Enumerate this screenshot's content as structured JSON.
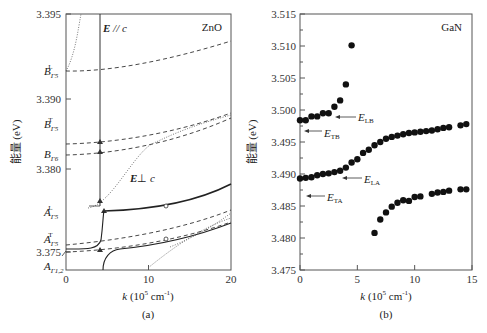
{
  "figure": {
    "panel_a_caption": "(a)",
    "panel_b_caption": "(b)"
  },
  "chart_data": [
    {
      "type": "line",
      "panel": "a",
      "title": "ZnO",
      "xlabel": "k (10^5 cm^-1)",
      "xlabel_parts": {
        "var": "k",
        "unit": "(10",
        "exp": "5",
        "unit2": " cm",
        "exp2": "-1",
        "close": ")"
      },
      "ylabel": "能量 (eV)",
      "xlim": [
        0,
        20
      ],
      "x_ticks": [
        0,
        10,
        20
      ],
      "y_tick_labels": [
        "3.395",
        "3.390",
        "3.380",
        "3.375"
      ],
      "axis_note": "broken/non-linear energy axis",
      "annotations": [
        {
          "text": "E// c",
          "note": "polarization parallel"
        },
        {
          "text": "E⊥ c",
          "note": "polarization perpendicular"
        }
      ],
      "level_labels": [
        {
          "base": "B",
          "sub": "Γ5",
          "sup": "L"
        },
        {
          "base": "B",
          "sub": "Γ5",
          "sup": "T"
        },
        {
          "base": "B",
          "sub": "Γ6",
          "sup": ""
        },
        {
          "base": "A",
          "sub": "Γ5",
          "sup": "L"
        },
        {
          "base": "A",
          "sub": "Γ5",
          "sup": "T"
        },
        {
          "base": "A",
          "sub": "Γ1,2",
          "sup": ""
        }
      ],
      "series": [
        {
          "name": "B_Γ5^L dispersion",
          "style": "dashed"
        },
        {
          "name": "B_Γ5^T dispersion",
          "style": "dashed"
        },
        {
          "name": "B_Γ6 dispersion",
          "style": "dashed"
        },
        {
          "name": "A_Γ5^L polariton",
          "style": "solid"
        },
        {
          "name": "A_Γ5^T dispersion",
          "style": "dashed"
        },
        {
          "name": "A_Γ1,2 dispersion",
          "style": "dashed"
        },
        {
          "name": "lower polariton branch",
          "style": "solid"
        },
        {
          "name": "photon-like branches",
          "style": "dotted"
        }
      ]
    },
    {
      "type": "scatter",
      "panel": "b",
      "title": "GaN",
      "xlabel": "k (10^5 cm^-1)",
      "xlabel_parts": {
        "var": "k",
        "unit": "(10",
        "exp": "5",
        "unit2": " cm",
        "exp2": "-1",
        "close": ")"
      },
      "ylabel": "能量 (eV)",
      "xlim": [
        0,
        15
      ],
      "ylim": [
        3.475,
        3.515
      ],
      "x_ticks": [
        0,
        5,
        10,
        15
      ],
      "y_ticks": [
        "3.475",
        "3.480",
        "3.485",
        "3.490",
        "3.495",
        "3.500",
        "3.505",
        "3.510",
        "3.515"
      ],
      "annotations": [
        {
          "text": "E",
          "sub": "LB"
        },
        {
          "text": "E",
          "sub": "TB"
        },
        {
          "text": "E",
          "sub": "LA"
        },
        {
          "text": "E",
          "sub": "TA"
        }
      ],
      "series": [
        {
          "name": "upper branch (B)",
          "x": [
            0.0,
            0.5,
            1.0,
            1.5,
            2.0,
            2.5,
            3.0,
            3.5,
            4.0,
            4.5
          ],
          "y": [
            3.4984,
            3.4984,
            3.499,
            3.499,
            3.4995,
            3.4995,
            3.5005,
            3.5015,
            3.504,
            3.5101
          ]
        },
        {
          "name": "middle branch",
          "x": [
            0.0,
            0.5,
            1.0,
            1.5,
            2.0,
            2.5,
            3.0,
            3.5,
            4.0,
            4.5,
            5.0,
            5.5,
            6.0,
            6.5,
            7.0,
            7.5,
            8.0,
            8.5,
            9.0,
            9.5,
            10.0,
            10.5,
            11.0,
            11.5,
            12.0,
            12.5,
            13.0,
            14.0,
            14.5
          ],
          "y": [
            3.4893,
            3.4894,
            3.4895,
            3.4898,
            3.49,
            3.4901,
            3.4903,
            3.4905,
            3.491,
            3.4918,
            3.4923,
            3.4933,
            3.4938,
            3.4945,
            3.495,
            3.4955,
            3.4958,
            3.496,
            3.4962,
            3.4964,
            3.4965,
            3.4966,
            3.4967,
            3.4968,
            3.497,
            3.4972,
            3.4973,
            3.4976,
            3.4978
          ]
        },
        {
          "name": "lower branch (A)",
          "x": [
            6.5,
            7.0,
            7.5,
            8.0,
            8.5,
            9.0,
            9.5,
            10.0,
            10.5,
            11.5,
            12.0,
            12.5,
            13.0,
            14.0,
            14.5
          ],
          "y": [
            3.4808,
            3.4829,
            3.484,
            3.4849,
            3.4855,
            3.4859,
            3.4858,
            3.4864,
            3.4865,
            3.4869,
            3.4871,
            3.4872,
            3.4874,
            3.4876,
            3.4876
          ]
        }
      ]
    }
  ]
}
